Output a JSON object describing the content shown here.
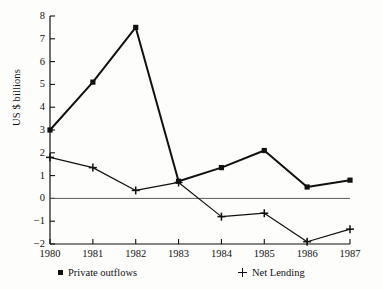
{
  "chart_data": {
    "type": "line",
    "title": "",
    "subtitle": "",
    "xlabel": "",
    "ylabel": "US $ billions",
    "categories": [
      "1980",
      "1981",
      "1982",
      "1983",
      "1984",
      "1985",
      "1986",
      "1987"
    ],
    "x": [
      1980,
      1981,
      1982,
      1983,
      1984,
      1985,
      1986,
      1987
    ],
    "xlim": [
      1980,
      1987
    ],
    "ylim": [
      -2,
      8
    ],
    "yticks": [
      8,
      7,
      6,
      5,
      4,
      3,
      2,
      1,
      0,
      -1,
      -2
    ],
    "ytick_labels": [
      "8",
      "7",
      "6",
      "5",
      "4",
      "3",
      "2",
      "1",
      "0",
      "−1",
      "−2"
    ],
    "grid": false,
    "zero_line": true,
    "legend_position": "bottom",
    "series": [
      {
        "name": "Private outflows",
        "marker": "square",
        "color": "#111111",
        "values": [
          3.0,
          5.1,
          7.5,
          0.75,
          1.35,
          2.1,
          0.5,
          0.8
        ]
      },
      {
        "name": "Net Lending",
        "marker": "plus",
        "color": "#111111",
        "values": [
          1.8,
          1.35,
          0.35,
          0.7,
          -0.8,
          -0.65,
          -1.9,
          -1.35
        ]
      }
    ]
  },
  "legend": {
    "entries": [
      {
        "label": "Private outflows",
        "marker": "square-marker-icon"
      },
      {
        "label": "Net Lending",
        "marker": "plus-marker-icon"
      }
    ]
  }
}
